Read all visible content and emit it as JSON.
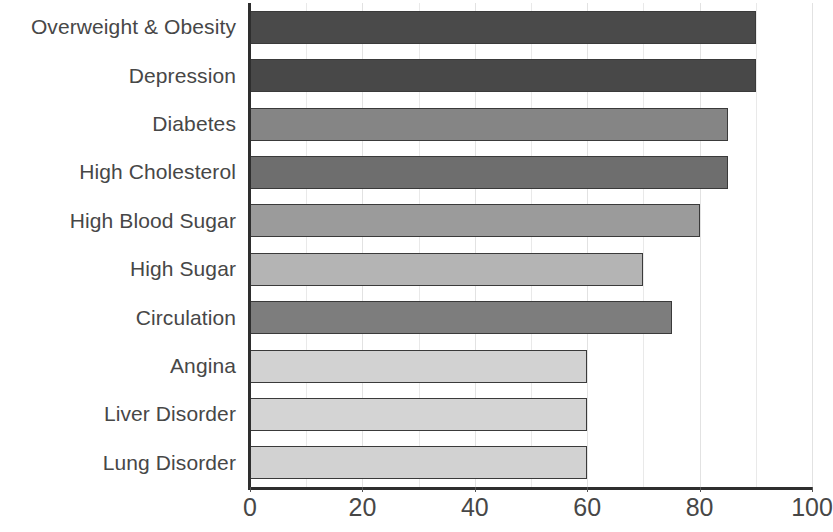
{
  "chart_data": {
    "type": "bar",
    "orientation": "horizontal",
    "title": "",
    "subtitle": "",
    "xlabel": "",
    "ylabel": "",
    "xlim": [
      0,
      100
    ],
    "xticks": [
      "0",
      "20",
      "40",
      "60",
      "80",
      "100"
    ],
    "xtick_values": [
      0,
      20,
      40,
      60,
      80,
      100
    ],
    "grid": true,
    "grid_axis": "x",
    "grid_minor_step": 10,
    "legend": "none",
    "categories": [
      "Overweight & Obesity",
      "Depression",
      "Diabetes",
      "High Cholesterol",
      "High Blood Sugar",
      "High Sugar",
      "Circulation",
      "Angina",
      "Liver Disorder",
      "Lung Disorder"
    ],
    "values": [
      90,
      90,
      85,
      85,
      80,
      70,
      75,
      60,
      60,
      60
    ],
    "bar_colors": [
      "#4a4a4a",
      "#484848",
      "#858585",
      "#6e6e6e",
      "#9b9b9b",
      "#b4b4b4",
      "#7d7d7d",
      "#d2d2d2",
      "#d4d4d4",
      "#d2d2d2"
    ],
    "bar_edge_color": "#3a3a3a",
    "axis_color": "#2e2e2e",
    "grid_color": "#e6e6e6",
    "label_color": "#474747",
    "background_color": "#ffffff"
  }
}
